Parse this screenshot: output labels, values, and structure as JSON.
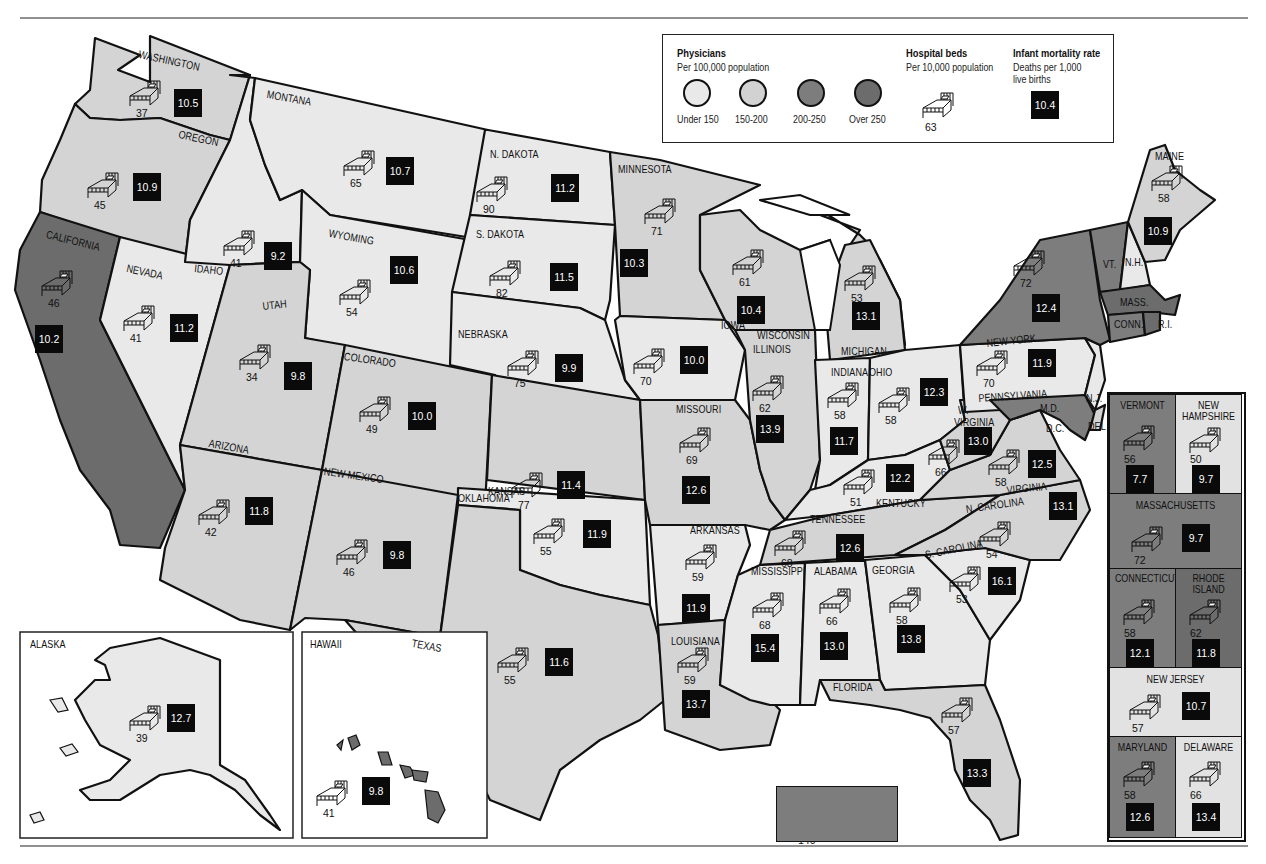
{
  "legend": {
    "physicians_title": "Physicians",
    "physicians_sub": "Per 100,000 population",
    "categories": [
      {
        "label": "Under 150",
        "color": "#e9e9e9"
      },
      {
        "label": "150-200",
        "color": "#d2d2d2"
      },
      {
        "label": "200-250",
        "color": "#7d7d7d"
      },
      {
        "label": "Over 250",
        "color": "#6c6c6c"
      }
    ],
    "beds_title": "Hospital beds",
    "beds_sub": "Per 10,000 population",
    "beds_example": "63",
    "infant_title": "Infant mortality rate",
    "infant_sub1": "Deaths per 1,000",
    "infant_sub2": "live births",
    "infant_example": "10.4"
  },
  "states": {
    "washington": {
      "name": "WASHINGTON",
      "beds": "37",
      "infant": "10.5"
    },
    "oregon": {
      "name": "OREGON",
      "beds": "45",
      "infant": "10.9"
    },
    "california": {
      "name": "CALIFORNIA",
      "beds": "46",
      "infant": "10.2"
    },
    "nevada": {
      "name": "NEVADA",
      "beds": "41",
      "infant": "11.2"
    },
    "idaho": {
      "name": "IDAHO",
      "beds": "41",
      "infant": "9.2"
    },
    "montana": {
      "name": "MONTANA",
      "beds": "65",
      "infant": "10.7"
    },
    "wyoming": {
      "name": "WYOMING",
      "beds": "54",
      "infant": "10.6"
    },
    "utah": {
      "name": "UTAH",
      "beds": "34",
      "infant": "9.8"
    },
    "colorado": {
      "name": "COLORADO",
      "beds": "49",
      "infant": "10.0"
    },
    "arizona": {
      "name": "ARIZONA",
      "beds": "42",
      "infant": "11.8"
    },
    "new_mexico": {
      "name": "NEW MEXICO",
      "beds": "46",
      "infant": "9.8"
    },
    "n_dakota": {
      "name": "N. DAKOTA",
      "beds": "90",
      "infant": "11.2"
    },
    "s_dakota": {
      "name": "S. DAKOTA",
      "beds": "82",
      "infant": "11.5"
    },
    "nebraska": {
      "name": "NEBRASKA",
      "beds": "75",
      "infant": "9.9"
    },
    "kansas": {
      "name": "KANSAS",
      "beds": "77",
      "infant": "11.4"
    },
    "oklahoma": {
      "name": "OKLAHOMA",
      "beds": "55",
      "infant": "11.9"
    },
    "texas": {
      "name": "TEXAS",
      "beds": "55",
      "infant": "11.6"
    },
    "minnesota": {
      "name": "MINNESOTA",
      "beds": "71",
      "infant": "10.3"
    },
    "iowa": {
      "name": "IOWA",
      "beds": "70",
      "infant": "10.0"
    },
    "missouri": {
      "name": "MISSOURI",
      "beds": "69",
      "infant": "12.6"
    },
    "arkansas": {
      "name": "ARKANSAS",
      "beds": "59",
      "infant": "11.9"
    },
    "louisiana": {
      "name": "LOUISIANA",
      "beds": "59",
      "infant": "13.7"
    },
    "wisconsin": {
      "name": "WISCONSIN",
      "beds": "61",
      "infant": "10.4"
    },
    "illinois": {
      "name": "ILLINOIS",
      "beds": "62",
      "infant": "13.9"
    },
    "michigan": {
      "name": "MICHIGAN",
      "beds": "53",
      "infant": "13.1"
    },
    "indiana": {
      "name": "INDIANA",
      "beds": "58",
      "infant": "11.7"
    },
    "ohio": {
      "name": "OHIO",
      "beds": "58",
      "infant": "12.3"
    },
    "kentucky": {
      "name": "KENTUCKY",
      "beds": "51",
      "infant": "12.2"
    },
    "tennessee": {
      "name": "TENNESSEE",
      "beds": "68",
      "infant": "12.6"
    },
    "mississippi": {
      "name": "MISSISSIPPI",
      "beds": "68",
      "infant": "15.4"
    },
    "alabama": {
      "name": "ALABAMA",
      "beds": "66",
      "infant": "13.0"
    },
    "georgia": {
      "name": "GEORGIA",
      "beds": "58",
      "infant": "13.8"
    },
    "florida": {
      "name": "FLORIDA",
      "beds": "57",
      "infant": "13.3"
    },
    "s_carolina": {
      "name": "S. CAROLINA",
      "beds": "53",
      "infant": "16.1"
    },
    "n_carolina": {
      "name": "N. CAROLINA",
      "beds": "54",
      "infant": "13.1"
    },
    "virginia": {
      "name": "VIRGINIA",
      "beds": "58",
      "infant": "12.5"
    },
    "w_virginia": {
      "name": "W. VIRGINIA",
      "beds": "66",
      "infant": "13.0"
    },
    "pennsylvania": {
      "name": "PENNSYLVANIA",
      "beds": "70",
      "infant": "11.9"
    },
    "new_york": {
      "name": "NEW YORK",
      "beds": "72",
      "infant": "12.4"
    },
    "maine": {
      "name": "MAINE",
      "beds": "58",
      "infant": "10.9"
    },
    "alaska": {
      "name": "ALASKA",
      "beds": "39",
      "infant": "12.7"
    },
    "hawaii": {
      "name": "HAWAII",
      "beds": "41",
      "infant": "9.8"
    },
    "dc": {
      "name": "DISTRICT OF COLUMBIA",
      "beds": "140",
      "infant": "25.1"
    }
  },
  "small_labels": {
    "vt": "VT.",
    "nh": "N.H.",
    "mass": "MASS.",
    "conn": "CONN.",
    "ri": "R.I.",
    "nj": "N.J.",
    "md": "M.D.",
    "dc": "D.C.",
    "del": "DEL",
    "w_virginia_w": "W.",
    "w_virginia_v": "VIRGINIA"
  },
  "northeast_panel": {
    "vermont": {
      "name": "VERMONT",
      "beds": "56",
      "infant": "7.7"
    },
    "new_hampshire": {
      "name1": "NEW",
      "name2": "HAMPSHIRE",
      "beds": "50",
      "infant": "9.7"
    },
    "massachusetts": {
      "name": "MASSACHUSETTS",
      "beds": "72",
      "infant": "9.7"
    },
    "connecticut": {
      "name": "CONNECTICUT",
      "beds": "58",
      "infant": "12.1"
    },
    "rhode_island": {
      "name1": "RHODE",
      "name2": "ISLAND",
      "beds": "62",
      "infant": "11.8"
    },
    "new_jersey": {
      "name": "NEW JERSEY",
      "beds": "57",
      "infant": "10.7"
    },
    "maryland": {
      "name": "MARYLAND",
      "beds": "58",
      "infant": "12.6"
    },
    "delaware": {
      "name": "DELAWARE",
      "beds": "66",
      "infant": "13.4"
    }
  }
}
